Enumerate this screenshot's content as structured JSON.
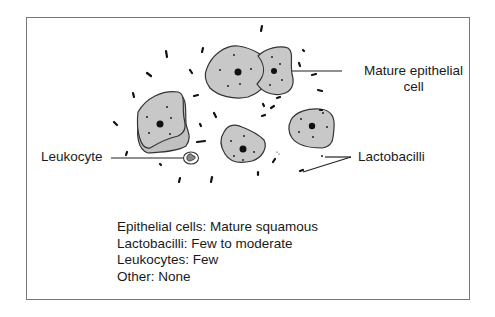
{
  "diagram": {
    "type": "wet-mount microscopy illustration",
    "labels": {
      "mature_epithelial_cell_line1": "Mature epithelial",
      "mature_epithelial_cell_line2": "cell",
      "leukocyte": "Leukocyte",
      "lactobacilli": "Lactobacilli"
    },
    "summary": [
      {
        "text": "Epithelial cells: Mature squamous"
      },
      {
        "text": "Lactobacilli: Few to moderate"
      },
      {
        "text": "Leukocytes: Few"
      },
      {
        "text": "Other: None"
      }
    ],
    "colors": {
      "cell_fill": "#c8c8c8",
      "cell_stroke": "#333333",
      "frame": "#777777",
      "text": "#1a1a1a"
    }
  }
}
